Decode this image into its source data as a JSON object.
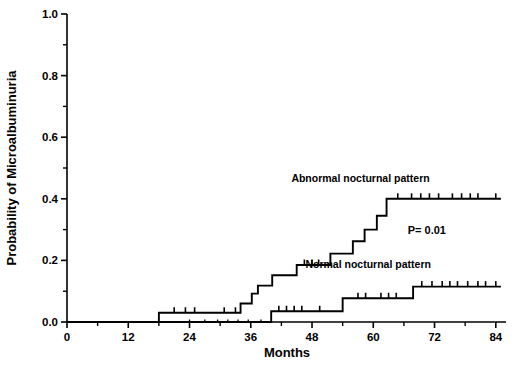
{
  "chart_data": {
    "type": "line",
    "title": "",
    "subtitle": "",
    "xlabel": "Months",
    "ylabel": "Probability of Microalbuminuria",
    "xlim": [
      0,
      86
    ],
    "ylim": [
      0.0,
      1.0
    ],
    "grid": false,
    "legend_position": "inline-annotation",
    "x_ticks": [
      0,
      12,
      24,
      36,
      48,
      60,
      72,
      84
    ],
    "x_tick_labels": [
      "0",
      "12",
      "24",
      "36",
      "48",
      "60",
      "72",
      "84"
    ],
    "x_minor_ticks": [
      6,
      18,
      30,
      42,
      54,
      66,
      78
    ],
    "y_ticks": [
      0.0,
      0.2,
      0.4,
      0.6,
      0.8,
      1.0
    ],
    "y_tick_labels": [
      "0.0",
      "0.2",
      "0.4",
      "0.6",
      "0.8",
      "1.0"
    ],
    "y_minor_ticks": [
      0.1,
      0.3,
      0.5,
      0.7,
      0.9
    ],
    "annotations": [
      {
        "name": "p-value",
        "text": "P= 0.01",
        "x": 70.5,
        "y": 0.285
      },
      {
        "name": "abnormal-series-label",
        "text": "Abnormal nocturnal pattern",
        "x": 57.5,
        "y": 0.455
      },
      {
        "name": "normal-series-label",
        "text": "Normal nocturnal pattern",
        "x": 59.0,
        "y": 0.175
      }
    ],
    "series": [
      {
        "name": "Abnormal nocturnal pattern",
        "color": "#000000",
        "step_type": "post",
        "points": [
          {
            "x": 18.0,
            "y": 0.0
          },
          {
            "x": 18.0,
            "y": 0.03
          },
          {
            "x": 34.0,
            "y": 0.03
          },
          {
            "x": 34.0,
            "y": 0.06
          },
          {
            "x": 36.2,
            "y": 0.06
          },
          {
            "x": 36.2,
            "y": 0.092
          },
          {
            "x": 37.4,
            "y": 0.092
          },
          {
            "x": 37.4,
            "y": 0.118
          },
          {
            "x": 40.2,
            "y": 0.118
          },
          {
            "x": 40.2,
            "y": 0.152
          },
          {
            "x": 45.0,
            "y": 0.152
          },
          {
            "x": 45.0,
            "y": 0.185
          },
          {
            "x": 51.6,
            "y": 0.185
          },
          {
            "x": 51.6,
            "y": 0.222
          },
          {
            "x": 56.0,
            "y": 0.222
          },
          {
            "x": 56.0,
            "y": 0.262
          },
          {
            "x": 58.3,
            "y": 0.262
          },
          {
            "x": 58.3,
            "y": 0.3
          },
          {
            "x": 60.7,
            "y": 0.3
          },
          {
            "x": 60.7,
            "y": 0.345
          },
          {
            "x": 62.6,
            "y": 0.345
          },
          {
            "x": 62.6,
            "y": 0.4
          },
          {
            "x": 85.0,
            "y": 0.4
          }
        ],
        "censor_x": [
          21.0,
          23.2,
          25.0,
          30.8,
          33.0,
          46.5,
          48.0,
          49.3,
          64.8,
          67.5,
          69.3,
          71.0,
          72.8,
          75.5,
          77.3,
          79.0,
          80.5,
          84.0
        ],
        "censor_y": [
          0.03,
          0.03,
          0.03,
          0.03,
          0.03,
          0.185,
          0.185,
          0.185,
          0.4,
          0.4,
          0.4,
          0.4,
          0.4,
          0.4,
          0.4,
          0.4,
          0.4,
          0.4
        ]
      },
      {
        "name": "Normal nocturnal pattern",
        "color": "#000000",
        "step_type": "post",
        "points": [
          {
            "x": 0.0,
            "y": 0.0
          },
          {
            "x": 40.0,
            "y": 0.0
          },
          {
            "x": 40.0,
            "y": 0.035
          },
          {
            "x": 54.0,
            "y": 0.035
          },
          {
            "x": 54.0,
            "y": 0.077
          },
          {
            "x": 67.8,
            "y": 0.077
          },
          {
            "x": 67.8,
            "y": 0.115
          },
          {
            "x": 85.0,
            "y": 0.115
          }
        ],
        "censor_x": [
          24.0,
          27.0,
          29.5,
          31.5,
          33.5,
          35.5,
          38.0,
          41.5,
          43.0,
          44.5,
          46.0,
          49.5,
          57.0,
          58.5,
          61.5,
          63.0,
          64.5,
          69.5,
          71.5,
          73.5,
          75.0,
          76.5,
          78.5,
          80.5,
          82.0,
          84.0
        ],
        "censor_y": [
          0.0,
          0.0,
          0.0,
          0.0,
          0.0,
          0.0,
          0.0,
          0.035,
          0.035,
          0.035,
          0.035,
          0.035,
          0.077,
          0.077,
          0.077,
          0.077,
          0.077,
          0.115,
          0.115,
          0.115,
          0.115,
          0.115,
          0.115,
          0.115,
          0.115,
          0.115
        ]
      }
    ]
  }
}
